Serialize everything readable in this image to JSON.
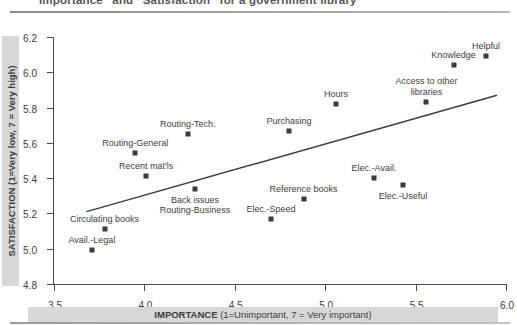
{
  "title": "“Importance” and “Satisfaction” for a government library",
  "axes": {
    "y_band_label": "SATISFACTION (1=Very low, 7 = Very high)",
    "x_band_label_bold": "IMPORTANCE ",
    "x_band_label_thin": "(1=Unimportant, 7 = Very important)"
  },
  "chart_data": {
    "type": "scatter",
    "title": "“Importance” and “Satisfaction” for a government library",
    "xlabel": "IMPORTANCE (1=Unimportant, 7 = Very important)",
    "ylabel": "SATISFACTION (1=Very low, 7 = Very high)",
    "xlim": [
      3.5,
      6.0
    ],
    "ylim": [
      4.8,
      6.2
    ],
    "xticks": [
      "3.5",
      "4.0",
      "4.5",
      "5.0",
      "5.5",
      "6.0"
    ],
    "yticks": [
      "4.8",
      "5.0",
      "5.2",
      "5.4",
      "5.6",
      "5.8",
      "6.0",
      "6.2"
    ],
    "grid": false,
    "legend": "none",
    "marker": "filled-square",
    "marker_color": "#3b3b3b",
    "points": [
      {
        "label": "Helpful",
        "x": 5.89,
        "y": 6.09,
        "label_pos": "above"
      },
      {
        "label": "Knowledge",
        "x": 5.71,
        "y": 6.04,
        "label_pos": "above"
      },
      {
        "label": "Access to other\nlibraries",
        "x": 5.56,
        "y": 5.83,
        "label_pos": "above"
      },
      {
        "label": "Hours",
        "x": 5.06,
        "y": 5.82,
        "label_pos": "above"
      },
      {
        "label": "Purchasing",
        "x": 4.8,
        "y": 5.67,
        "label_pos": "above"
      },
      {
        "label": "Routing-Tech.",
        "x": 4.24,
        "y": 5.65,
        "label_pos": "above"
      },
      {
        "label": "Routing-General",
        "x": 3.95,
        "y": 5.54,
        "label_pos": "above"
      },
      {
        "label": "Recent mat'ls",
        "x": 4.01,
        "y": 5.41,
        "label_pos": "above"
      },
      {
        "label": "Elec.-Avail.",
        "x": 5.27,
        "y": 5.4,
        "label_pos": "above"
      },
      {
        "label": "Elec.-Useful",
        "x": 5.43,
        "y": 5.36,
        "label_pos": "below"
      },
      {
        "label": "Back issues\nRouting-Business",
        "x": 4.28,
        "y": 5.34,
        "label_pos": "below"
      },
      {
        "label": "Reference books",
        "x": 4.88,
        "y": 5.28,
        "label_pos": "above"
      },
      {
        "label": "Elec.-Speed",
        "x": 4.7,
        "y": 5.17,
        "label_pos": "above"
      },
      {
        "label": "Circulating books",
        "x": 3.78,
        "y": 5.11,
        "label_pos": "above"
      },
      {
        "label": "Avail.-Legal",
        "x": 3.71,
        "y": 4.99,
        "label_pos": "above"
      }
    ],
    "trendline": {
      "x1": 3.68,
      "y1": 5.21,
      "x2": 5.95,
      "y2": 5.87,
      "color": "#3b3b3b"
    }
  }
}
